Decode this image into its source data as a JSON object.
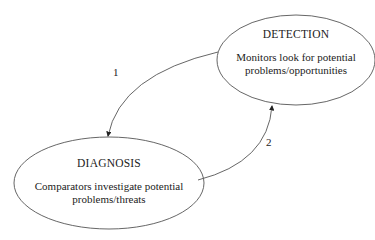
{
  "diagram": {
    "nodes": [
      {
        "id": "detection",
        "title": "DETECTION",
        "lines": [
          "Monitors look for potential",
          "problems/opportunities"
        ]
      },
      {
        "id": "diagnosis",
        "title": "DIAGNOSIS",
        "lines": [
          "Comparators investigate potential",
          "problems/threats"
        ]
      }
    ],
    "edges": [
      {
        "from": "detection",
        "to": "diagnosis",
        "label": "1"
      },
      {
        "from": "diagnosis",
        "to": "detection",
        "label": "2"
      }
    ]
  }
}
